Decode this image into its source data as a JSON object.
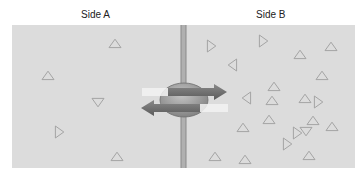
{
  "labels": {
    "side_a": "Side A",
    "side_b": "Side B"
  },
  "colors": {
    "background": "#dcdcdc",
    "membrane": "#b0b0b0",
    "membrane_edge": "#8a8a8a",
    "triangle_stroke": "#a4a4a4",
    "transporter": "#9a9a9a",
    "arrow": "#6e6e6e",
    "arrow_highlight": "#f2f2f2"
  },
  "transporter": {
    "cx": 184,
    "cy": 100,
    "rx": 24,
    "ry": 17,
    "arrow_right": {
      "direction": "A-to-B",
      "y": 92
    },
    "arrow_left": {
      "direction": "B-to-A",
      "y": 108
    }
  },
  "triangles": {
    "side_a": [
      {
        "x": 115,
        "y": 44,
        "dir": "up"
      },
      {
        "x": 48,
        "y": 76,
        "dir": "up"
      },
      {
        "x": 98,
        "y": 102,
        "dir": "down"
      },
      {
        "x": 59,
        "y": 132,
        "dir": "right"
      },
      {
        "x": 117,
        "y": 157,
        "dir": "up"
      }
    ],
    "side_b": [
      {
        "x": 211,
        "y": 46,
        "dir": "right"
      },
      {
        "x": 263,
        "y": 41,
        "dir": "right"
      },
      {
        "x": 300,
        "y": 55,
        "dir": "up"
      },
      {
        "x": 331,
        "y": 47,
        "dir": "up"
      },
      {
        "x": 233,
        "y": 65,
        "dir": "left"
      },
      {
        "x": 322,
        "y": 76,
        "dir": "up"
      },
      {
        "x": 274,
        "y": 87,
        "dir": "up"
      },
      {
        "x": 247,
        "y": 98,
        "dir": "left"
      },
      {
        "x": 305,
        "y": 99,
        "dir": "up"
      },
      {
        "x": 318,
        "y": 102,
        "dir": "right"
      },
      {
        "x": 272,
        "y": 101,
        "dir": "up"
      },
      {
        "x": 313,
        "y": 121,
        "dir": "up"
      },
      {
        "x": 269,
        "y": 120,
        "dir": "up"
      },
      {
        "x": 243,
        "y": 128,
        "dir": "up"
      },
      {
        "x": 297,
        "y": 133,
        "dir": "right"
      },
      {
        "x": 306,
        "y": 131,
        "dir": "down"
      },
      {
        "x": 332,
        "y": 127,
        "dir": "up"
      },
      {
        "x": 215,
        "y": 157,
        "dir": "up"
      },
      {
        "x": 245,
        "y": 160,
        "dir": "up"
      },
      {
        "x": 287,
        "y": 144,
        "dir": "right"
      },
      {
        "x": 309,
        "y": 156,
        "dir": "up"
      }
    ]
  }
}
